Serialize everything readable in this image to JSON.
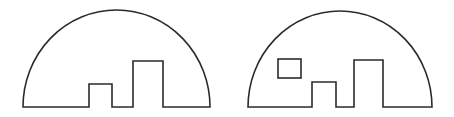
{
  "figure": {
    "stroke_color": "#2b2b2b",
    "background_color": "#ffffff",
    "shapes": [
      {
        "name": "semicircle-with-two-notches",
        "base_left_x": 23,
        "base_right_x": 210,
        "base_y": 107,
        "arc_top_y": 10,
        "protrusions": [
          {
            "name": "small-bar",
            "x1": 89,
            "x2": 112,
            "top_y": 84
          },
          {
            "name": "tall-bar",
            "x1": 133,
            "x2": 163,
            "top_y": 61
          }
        ],
        "holes": []
      },
      {
        "name": "semicircle-with-two-notches-and-window",
        "base_left_x": 248,
        "base_right_x": 432,
        "base_y": 107,
        "arc_top_y": 11,
        "protrusions": [
          {
            "name": "small-bar",
            "x1": 312,
            "x2": 336,
            "top_y": 82
          },
          {
            "name": "tall-bar",
            "x1": 354,
            "x2": 383,
            "top_y": 60
          }
        ],
        "holes": [
          {
            "name": "square-window",
            "x": 278,
            "y": 59,
            "width": 23,
            "height": 19
          }
        ]
      }
    ]
  }
}
